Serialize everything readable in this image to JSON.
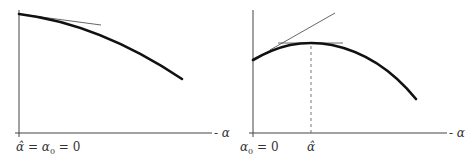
{
  "colors": {
    "axis": "#444444",
    "curve": "#111111",
    "tangent": "#555555",
    "dashed": "#666666",
    "background": "#ffffff"
  },
  "panels": [
    {
      "id": "left",
      "axis_label": "- α",
      "origin_label": {
        "hat_alpha": "α̂",
        "eq1": " = ",
        "alpha": "α",
        "sub": "0",
        "eq2": " = 0"
      },
      "description": "Concave decreasing curve starting at origin with tangent line at α = 0; maximum at α̂ = α₀ = 0"
    },
    {
      "id": "right",
      "axis_label": "- α",
      "origin_label": {
        "alpha": "α",
        "sub": "0",
        "eq": " = 0"
      },
      "max_label": "α̂",
      "description": "Concave curve increasing to a maximum at α̂ then decreasing; tangent at α₀ and horizontal tangent at maximum with dashed drop line"
    }
  ]
}
